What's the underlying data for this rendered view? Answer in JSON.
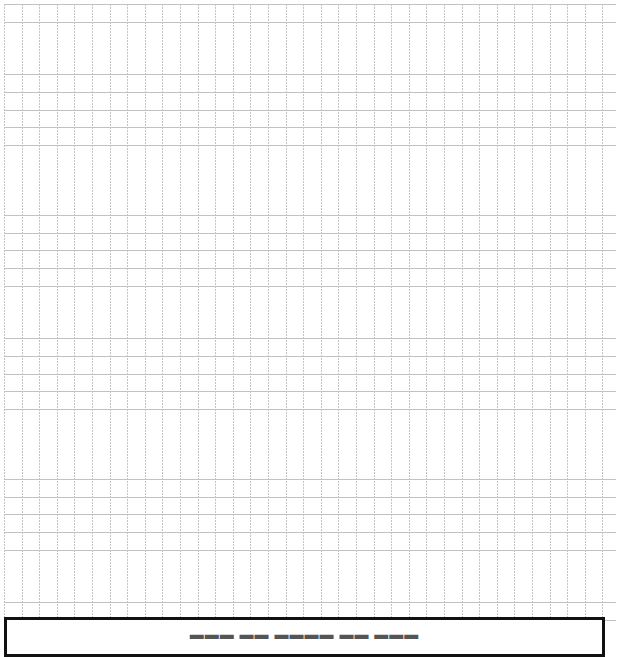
{
  "grid": {
    "line_color": "#b8b8b8",
    "cell_size_px": 17.6,
    "style": "dotted"
  },
  "bottom_box": {
    "border_color": "#111111",
    "label": "▬▬▬ ▬▬ ▬▬▬▬ ▬▬ ▬▬▬"
  }
}
